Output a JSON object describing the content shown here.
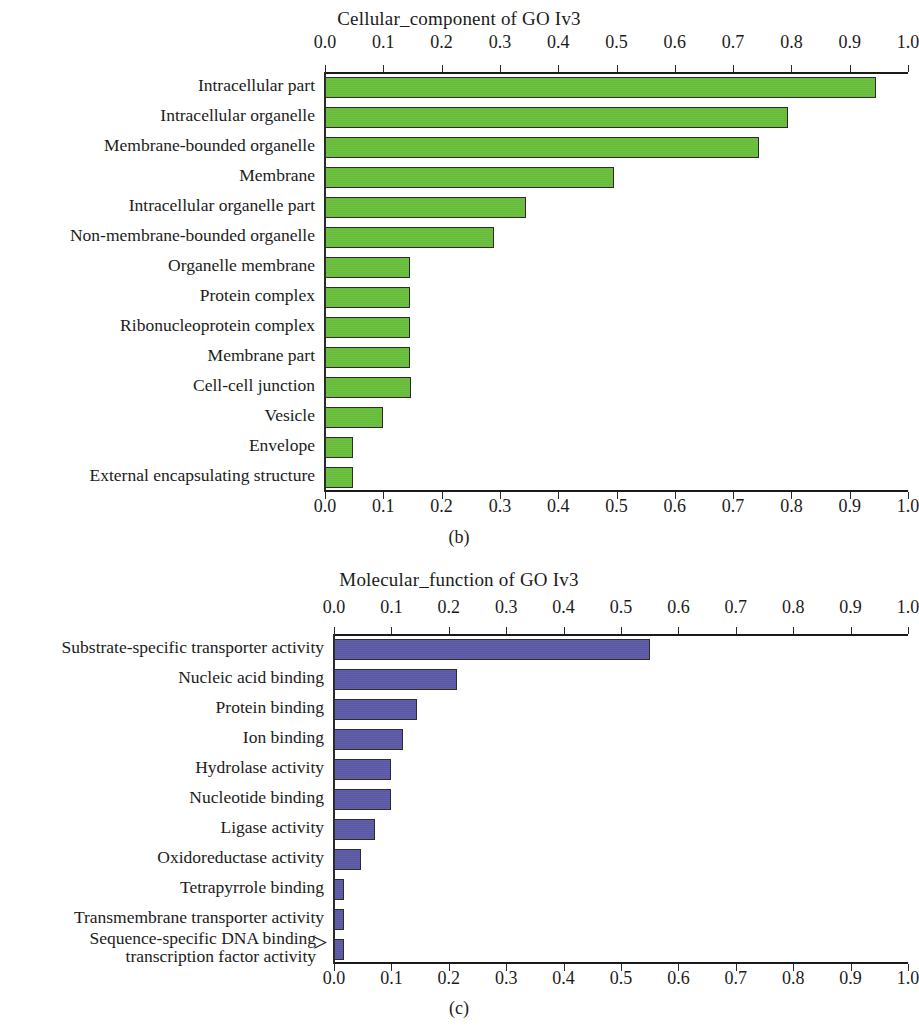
{
  "figure": {
    "panels": [
      {
        "caption": "(b)",
        "title": "Cellular_component of GO Iv3",
        "color": "#6cc23f"
      },
      {
        "caption": "(c)",
        "title": "Molecular_function of GO Iv3",
        "color": "#5a57a4"
      }
    ]
  },
  "axis": {
    "ticks": [
      "0.0",
      "0.1",
      "0.2",
      "0.3",
      "0.4",
      "0.5",
      "0.6",
      "0.7",
      "0.8",
      "0.9",
      "1.0"
    ]
  },
  "chart_data": [
    {
      "type": "bar",
      "orientation": "horizontal",
      "title": "Cellular_component of GO Iv3",
      "panel": "(b)",
      "xlabel": "",
      "ylabel": "",
      "xlim": [
        0,
        1.0
      ],
      "grid": false,
      "legend": "none",
      "bar_color": "#6cc23f",
      "xticks": [
        0.0,
        0.1,
        0.2,
        0.3,
        0.4,
        0.5,
        0.6,
        0.7,
        0.8,
        0.9,
        1.0
      ],
      "xticklabels": [
        "0.0",
        "0.1",
        "0.2",
        "0.3",
        "0.4",
        "0.5",
        "0.6",
        "0.7",
        "0.8",
        "0.9",
        "1.0"
      ],
      "axis_top": true,
      "axis_bottom": true,
      "categories": [
        "Intracellular part",
        "Intracellular organelle",
        "Membrane-bounded organelle",
        "Membrane",
        "Intracellular organelle part",
        "Non-membrane-bounded organelle",
        "Organelle membrane",
        "Protein complex",
        "Ribonucleoprotein complex",
        "Membrane part",
        "Cell-cell junction",
        "Vesicle",
        "Envelope",
        "External encapsulating structure"
      ],
      "values": [
        0.945,
        0.795,
        0.745,
        0.495,
        0.345,
        0.29,
        0.145,
        0.145,
        0.145,
        0.145,
        0.148,
        0.1,
        0.048,
        0.048
      ]
    },
    {
      "type": "bar",
      "orientation": "horizontal",
      "title": "Molecular_function of GO Iv3",
      "panel": "(c)",
      "xlabel": "",
      "ylabel": "",
      "xlim": [
        0,
        1.0
      ],
      "grid": false,
      "legend": "none",
      "bar_color": "#5a57a4",
      "xticks": [
        0.0,
        0.1,
        0.2,
        0.3,
        0.4,
        0.5,
        0.6,
        0.7,
        0.8,
        0.9,
        1.0
      ],
      "xticklabels": [
        "0.0",
        "0.1",
        "0.2",
        "0.3",
        "0.4",
        "0.5",
        "0.6",
        "0.7",
        "0.8",
        "0.9",
        "1.0"
      ],
      "axis_top": true,
      "axis_bottom": true,
      "categories": [
        "Substrate-specific transporter activity",
        "Nucleic acid binding",
        "Protein binding",
        "Ion binding",
        "Hydrolase activity",
        "Nucleotide binding",
        "Ligase activity",
        "Oxidoreductase activity",
        "Tetrapyrrole binding",
        "Transmembrane transporter activity",
        "Sequence-specific DNA binding transcription factor activity"
      ],
      "category_lines": [
        [
          "Substrate-specific transporter activity"
        ],
        [
          "Nucleic acid binding"
        ],
        [
          "Protein binding"
        ],
        [
          "Ion binding"
        ],
        [
          "Hydrolase activity"
        ],
        [
          "Nucleotide binding"
        ],
        [
          "Ligase activity"
        ],
        [
          "Oxidoreductase activity"
        ],
        [
          "Tetrapyrrole binding"
        ],
        [
          "Transmembrane transporter activity"
        ],
        [
          "Sequence-specific DNA binding",
          "transcription factor activity"
        ]
      ],
      "values": [
        0.55,
        0.215,
        0.145,
        0.12,
        0.1,
        0.1,
        0.072,
        0.047,
        0.018,
        0.018,
        0.018
      ]
    }
  ]
}
